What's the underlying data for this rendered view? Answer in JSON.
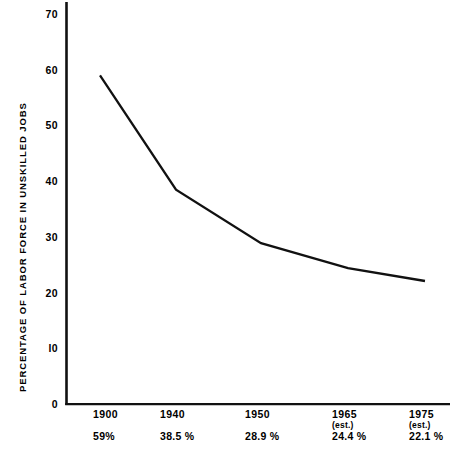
{
  "chart_data": {
    "type": "line",
    "title": "",
    "xlabel": "",
    "ylabel": "PERCENTAGE OF LABOR FORCE IN UNSKILLED JOBS",
    "categories": [
      "1900",
      "1940",
      "1950",
      "1965",
      "1975"
    ],
    "category_notes": [
      "",
      "",
      "",
      "(est.)",
      "(est.)"
    ],
    "values": [
      59,
      38.5,
      28.9,
      24.4,
      22.1
    ],
    "value_labels": [
      "59%",
      "38.5 %",
      "28.9 %",
      "24.4 %",
      "22.1 %"
    ],
    "ylim": [
      0,
      70
    ],
    "yticks": [
      70,
      60,
      50,
      40,
      30,
      20,
      10,
      0
    ],
    "ytick_labels": [
      "70",
      "60",
      "50",
      "40",
      "30",
      "20",
      "l0",
      "0"
    ],
    "grid": false,
    "legend": "none",
    "line_color": "#111111",
    "axis_color": "#111111",
    "background_color": "#ffffff"
  }
}
